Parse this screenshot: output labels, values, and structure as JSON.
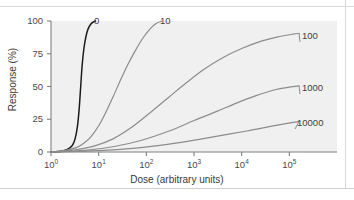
{
  "chart_data": {
    "type": "line",
    "title": "",
    "xlabel": "Dose (arbitrary units)",
    "ylabel": "Response (%)",
    "xscale": "log",
    "xlim": [
      1,
      1000000
    ],
    "ylim": [
      0,
      100
    ],
    "grid": false,
    "legend_position": "inline-curve-labels",
    "plot_background": "#f0f0f0",
    "xticks": [
      {
        "label": "10",
        "exponent": "0",
        "value": 1
      },
      {
        "label": "10",
        "exponent": "1",
        "value": 10
      },
      {
        "label": "10",
        "exponent": "2",
        "value": 100
      },
      {
        "label": "10",
        "exponent": "3",
        "value": 1000
      },
      {
        "label": "10",
        "exponent": "4",
        "value": 10000
      },
      {
        "label": "10",
        "exponent": "5",
        "value": 100000
      }
    ],
    "yticks": [
      "0",
      "25",
      "50",
      "75",
      "100"
    ],
    "series": [
      {
        "name": "0",
        "label": "0",
        "color": "#1c1c1c",
        "points": [
          [
            1.0,
            0.0
          ],
          [
            1.6,
            0.6
          ],
          [
            2.2,
            2.0
          ],
          [
            2.8,
            5.0
          ],
          [
            3.2,
            10.0
          ],
          [
            3.6,
            20.0
          ],
          [
            3.9,
            33.0
          ],
          [
            4.2,
            50.0
          ],
          [
            4.5,
            66.0
          ],
          [
            4.9,
            79.0
          ],
          [
            5.4,
            88.0
          ],
          [
            6.0,
            94.0
          ],
          [
            6.8,
            97.5
          ],
          [
            7.6,
            99.2
          ],
          [
            8.6,
            100.0
          ]
        ]
      },
      {
        "name": "10",
        "label": "10",
        "color": "#8c8c8c",
        "points": [
          [
            1.0,
            0.0
          ],
          [
            2.0,
            1.2
          ],
          [
            3.5,
            3.5
          ],
          [
            5.0,
            7.0
          ],
          [
            7.0,
            12.0
          ],
          [
            10.0,
            20.0
          ],
          [
            14.0,
            30.0
          ],
          [
            20.0,
            42.0
          ],
          [
            28.0,
            54.0
          ],
          [
            40.0,
            66.0
          ],
          [
            58.0,
            77.0
          ],
          [
            85.0,
            87.0
          ],
          [
            120.0,
            94.0
          ],
          [
            160.0,
            98.0
          ],
          [
            210.0,
            100.0
          ]
        ]
      },
      {
        "name": "100",
        "label": "100",
        "color": "#8c8c8c",
        "points": [
          [
            1.0,
            0.0
          ],
          [
            3.0,
            1.5
          ],
          [
            8.0,
            4.5
          ],
          [
            20.0,
            10.0
          ],
          [
            50.0,
            19.0
          ],
          [
            120.0,
            30.0
          ],
          [
            300.0,
            42.0
          ],
          [
            700.0,
            53.0
          ],
          [
            1600.0,
            63.0
          ],
          [
            4000.0,
            72.0
          ],
          [
            10000.0,
            79.0
          ],
          [
            25000.0,
            84.5
          ],
          [
            60000.0,
            88.0
          ],
          [
            120000.0,
            90.0
          ],
          [
            160000.0,
            90.5
          ]
        ]
      },
      {
        "name": "1000",
        "label": "1000",
        "color": "#8c8c8c",
        "points": [
          [
            1.0,
            0.0
          ],
          [
            5.0,
            1.2
          ],
          [
            20.0,
            4.0
          ],
          [
            80.0,
            9.0
          ],
          [
            300.0,
            16.0
          ],
          [
            1000.0,
            24.0
          ],
          [
            3000.0,
            31.0
          ],
          [
            8000.0,
            37.5
          ],
          [
            20000.0,
            43.0
          ],
          [
            50000.0,
            47.5
          ],
          [
            100000.0,
            49.5
          ],
          [
            160000.0,
            50.5
          ]
        ]
      },
      {
        "name": "10000",
        "label": "10000",
        "color": "#8c8c8c",
        "points": [
          [
            1.0,
            0.0
          ],
          [
            10.0,
            1.0
          ],
          [
            60.0,
            3.0
          ],
          [
            300.0,
            6.0
          ],
          [
            1200.0,
            9.5
          ],
          [
            5000.0,
            13.5
          ],
          [
            15000.0,
            16.5
          ],
          [
            40000.0,
            19.5
          ],
          [
            90000.0,
            21.8
          ],
          [
            160000.0,
            23.2
          ]
        ]
      }
    ],
    "curve_label_positions": [
      {
        "name": "0",
        "left": 94,
        "top": 16
      },
      {
        "name": "10",
        "left": 160,
        "top": 16
      },
      {
        "name": "100",
        "left": 302,
        "top": 31
      },
      {
        "name": "1000",
        "left": 302,
        "top": 83
      },
      {
        "name": "10000",
        "left": 297,
        "top": 118
      }
    ]
  }
}
